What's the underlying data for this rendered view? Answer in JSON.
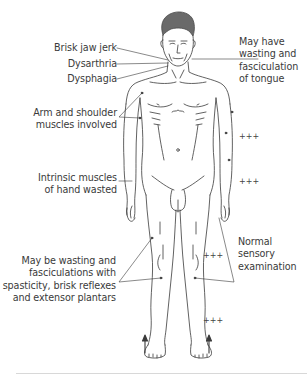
{
  "diagram": {
    "type": "anatomical-figure",
    "labels_left": [
      {
        "id": "jaw",
        "text": "Brisk jaw jerk"
      },
      {
        "id": "dysarthria",
        "text": "Dysarthria"
      },
      {
        "id": "dysphagia",
        "text": "Dysphagia"
      },
      {
        "id": "arm",
        "lines": [
          "Arm and shoulder",
          "muscles involved"
        ]
      },
      {
        "id": "hand",
        "lines": [
          "Intrinsic muscles",
          "of hand wasted"
        ]
      },
      {
        "id": "legs",
        "lines": [
          "May be wasting and",
          "fasciculations with",
          "spasticity, brisk reflexes",
          "and extensor plantars"
        ]
      }
    ],
    "labels_right": [
      {
        "id": "tongue",
        "lines": [
          "May have",
          "wasting and",
          "fasciculation",
          "of tongue"
        ]
      },
      {
        "id": "sensory",
        "lines": [
          "Normal",
          "sensory",
          "examination"
        ]
      }
    ],
    "sensory_marks": [
      {
        "id": "upper-arm",
        "text": "+++"
      },
      {
        "id": "forearm",
        "text": "+++"
      },
      {
        "id": "thigh",
        "text": "+++"
      },
      {
        "id": "shin",
        "text": "+++"
      }
    ],
    "plantar_arrows": [
      "up",
      "up"
    ],
    "colors": {
      "line": "#3a3a3a",
      "text": "#3a3a3a",
      "hair": "#6a6a6a",
      "rule": "#d8d8d8"
    }
  }
}
